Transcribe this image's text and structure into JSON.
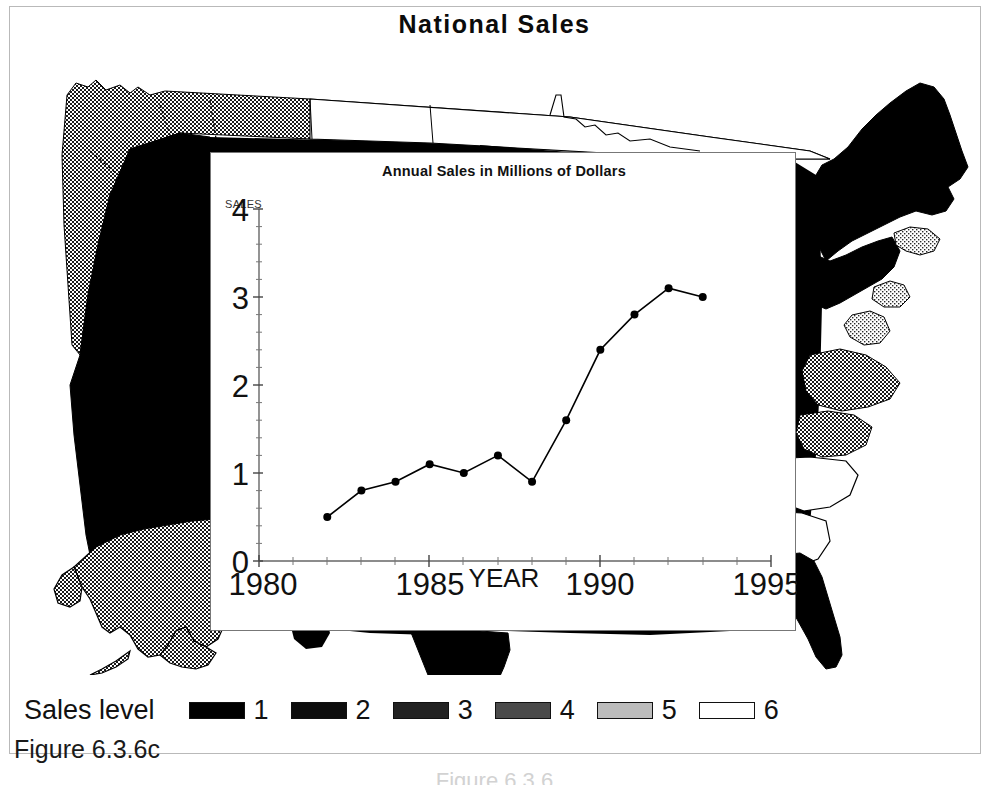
{
  "page": {
    "title": "National Sales",
    "figure_caption": "Figure 6.3.6c",
    "figure_caption_faint": "Figure 6.3.6"
  },
  "legend": {
    "title": "Sales level",
    "items": [
      {
        "label": "1",
        "color": "#000000"
      },
      {
        "label": "2",
        "color": "#0d0d0d"
      },
      {
        "label": "3",
        "color": "#222222"
      },
      {
        "label": "4",
        "color": "#4a4a4a"
      },
      {
        "label": "5",
        "color": "#bcbcbc"
      },
      {
        "label": "6",
        "color": "#ffffff"
      }
    ]
  },
  "chart_data": {
    "type": "line",
    "title": "Annual Sales in Millions of Dollars",
    "xlabel": "YEAR",
    "ylabel": "SALES",
    "xlim": [
      1980,
      1995
    ],
    "ylim": [
      0,
      4
    ],
    "grid": false,
    "legend": "none",
    "xticks": [
      "1980",
      "1985",
      "1990",
      "1995"
    ],
    "yticks": [
      "0",
      "1",
      "2",
      "3",
      "4"
    ],
    "x": [
      1982,
      1983,
      1984,
      1985,
      1986,
      1987,
      1988,
      1989,
      1990,
      1991,
      1992,
      1993
    ],
    "values": [
      0.5,
      0.8,
      0.9,
      1.1,
      1.0,
      1.2,
      0.9,
      1.6,
      2.4,
      2.8,
      3.1,
      3.0
    ],
    "marker": "filled-circle",
    "line_color": "#000000"
  },
  "map": {
    "name": "united-states-choropleth",
    "regions": [
      {
        "name": "pacific-northwest",
        "level": "4"
      },
      {
        "name": "california-nevada",
        "level": "1"
      },
      {
        "name": "northern-plains",
        "level": "6"
      },
      {
        "name": "northeast",
        "level": "1"
      },
      {
        "name": "mid-atlantic",
        "level": "5"
      },
      {
        "name": "southeast-carolina",
        "level": "3"
      },
      {
        "name": "florida",
        "level": "1"
      },
      {
        "name": "alaska",
        "level": "4"
      },
      {
        "name": "hawaii",
        "level": "1"
      }
    ]
  }
}
